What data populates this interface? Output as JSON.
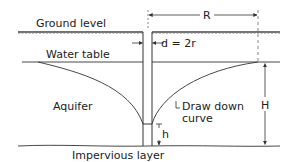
{
  "diagram": {
    "labels": {
      "ground_level": "Ground level",
      "water_table": "Water table",
      "aquifer": "Aquifer",
      "impervious_layer": "Impervious layer",
      "drawdown_curve_line1": "Draw down",
      "drawdown_curve_line2": "curve",
      "radius_of_influence": "R",
      "well_diameter": "d = 2r",
      "aquifer_thickness": "H",
      "well_water_depth": "h"
    },
    "colors": {
      "line": "#333333",
      "background": "#ffffff"
    }
  }
}
